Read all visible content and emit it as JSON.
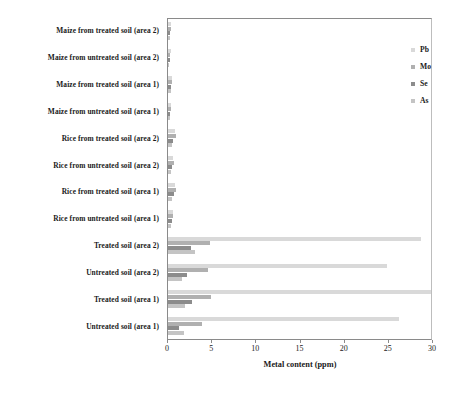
{
  "chart_data": {
    "type": "bar",
    "orientation": "horizontal",
    "title": "",
    "xlabel": "Metal content (ppm)",
    "ylabel": "",
    "xlim": [
      0,
      30
    ],
    "xticks": [
      0,
      5,
      10,
      15,
      20,
      25,
      30
    ],
    "grid": false,
    "legend_position": "top-right-inside",
    "categories": [
      "Maize from treated soil (area 2)",
      "Maize from untreated soil (area 2)",
      "Maize from treated soil (area 1)",
      "Maize from untreated soil (area 1)",
      "Rice from treated soil (area 2)",
      "Rice from untreated soil (area 2)",
      "Rice from treated soil (area 1)",
      "Rice from untreated soil (area 1)",
      "Treated soil (area 2)",
      "Untreated soil (area 2)",
      "Treated soil (area 1)",
      "Untreated soil (area 1)"
    ],
    "series": [
      {
        "name": "Pb",
        "color": "#d9d9d9",
        "values": [
          0.35,
          0.3,
          0.4,
          0.3,
          0.75,
          0.6,
          0.8,
          0.55,
          28.6,
          24.8,
          29.8,
          26.1
        ]
      },
      {
        "name": "Mo",
        "color": "#b0b0b0",
        "values": [
          0.3,
          0.25,
          0.45,
          0.3,
          0.9,
          0.7,
          0.95,
          0.6,
          4.7,
          4.5,
          4.9,
          3.8
        ]
      },
      {
        "name": "Se",
        "color": "#8c8c8c",
        "values": [
          0.25,
          0.2,
          0.35,
          0.25,
          0.6,
          0.5,
          0.7,
          0.45,
          2.6,
          2.2,
          2.7,
          1.2
        ]
      },
      {
        "name": "As",
        "color": "#c4c4c4",
        "values": [
          0.2,
          0.15,
          0.3,
          0.2,
          0.45,
          0.3,
          0.5,
          0.35,
          3.0,
          1.6,
          1.9,
          1.8
        ]
      }
    ]
  },
  "legend": {
    "items": [
      {
        "label": "Pb",
        "color": "#d9d9d9"
      },
      {
        "label": "Mo",
        "color": "#b0b0b0"
      },
      {
        "label": "Se",
        "color": "#8c8c8c"
      },
      {
        "label": "As",
        "color": "#c4c4c4"
      }
    ]
  }
}
